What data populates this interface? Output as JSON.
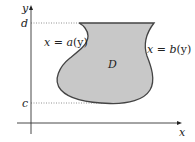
{
  "diagram": {
    "axes": {
      "x_label": "x",
      "y_label": "y"
    },
    "bounds": {
      "upper_label": "d",
      "lower_label": "c"
    },
    "region": {
      "label": "D",
      "fill_color": "#c8c8c8",
      "stroke_color": "#444444"
    },
    "curves": {
      "left": {
        "lhs": "x",
        "eq": " = ",
        "fn": "a",
        "arg": "(y)"
      },
      "right": {
        "lhs": "x",
        "eq": " = ",
        "fn": "b",
        "arg": "(y)"
      }
    }
  }
}
